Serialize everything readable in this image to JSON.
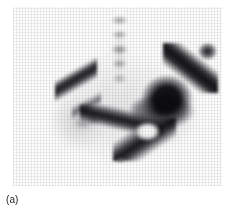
{
  "figure": {
    "caption": "(a)",
    "panel_label": "(a)",
    "modality_name": "bone-scintigraphy",
    "view": "anterior pelvis"
  },
  "scan": {
    "background_color": "#fdfdfd",
    "max_uptake_color": "#0a0a0a",
    "mid_uptake_color": "#6e6e73",
    "faint_uptake_color": "#b4b4b9",
    "photopenic_color": "#ffffff",
    "regions": [
      {
        "name": "lumbar-spine",
        "intensity": "faint",
        "position": "superior midline"
      },
      {
        "name": "left-linear-uptake",
        "intensity": "moderate",
        "position": "upper left oblique band"
      },
      {
        "name": "left-sacroiliac-region",
        "intensity": "moderate",
        "position": "mid left"
      },
      {
        "name": "right-hemipelvis-mass",
        "intensity": "intense",
        "position": "right centre"
      },
      {
        "name": "right-iliac-crest",
        "intensity": "intense",
        "position": "upper right oblique arm"
      },
      {
        "name": "superior-pubic-ramus",
        "intensity": "intense",
        "position": "mid band crossing midline"
      },
      {
        "name": "ischiopubic-ramus",
        "intensity": "intense",
        "position": "inferior right oblique"
      },
      {
        "name": "obturator-foramen",
        "intensity": "photopenic",
        "position": "enclosed by ramus ring"
      },
      {
        "name": "midline-focus",
        "intensity": "faint",
        "position": "inferior midline"
      }
    ]
  }
}
